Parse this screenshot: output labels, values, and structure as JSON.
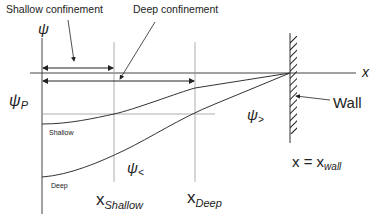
{
  "labels": {
    "shallow_confinement": "Shallow confinement",
    "deep_confinement": "Deep confinement",
    "psi_axis": "ψ",
    "x_axis": "x",
    "psi_p": "ψ",
    "psi_p_sub": "P",
    "shallow_curve": "Shallow",
    "deep_curve": "Deep",
    "psi_less": "ψ",
    "psi_less_sub": "<",
    "psi_greater": "ψ",
    "psi_greater_sub": ">",
    "wall": "Wall",
    "x_shallow": "x",
    "x_shallow_sub": "Shallow",
    "x_deep": "x",
    "x_deep_sub": "Deep",
    "x_wall_eq": "x = x",
    "x_wall_sub": "wall"
  },
  "colors": {
    "line": "#333333",
    "guide": "#999999",
    "text": "#222222"
  }
}
